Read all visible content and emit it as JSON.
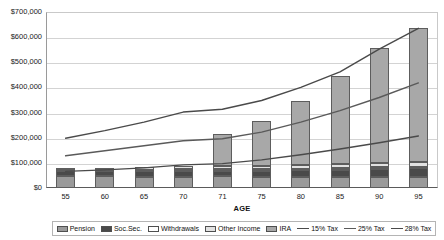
{
  "chart_data": {
    "type": "bar",
    "subtype": "stacked-bar-with-lines",
    "title": "",
    "xlabel": "AGE",
    "ylabel": "",
    "categories": [
      "55",
      "60",
      "65",
      "70",
      "71",
      "75",
      "80",
      "85",
      "90",
      "95"
    ],
    "ylim": [
      0,
      700000
    ],
    "y_ticks": [
      0,
      100000,
      200000,
      300000,
      400000,
      500000,
      600000,
      700000
    ],
    "y_tick_labels": [
      "$0",
      "$100,000",
      "$200,000",
      "$300,000",
      "$400,000",
      "$500,000",
      "$600,000",
      "$700,000"
    ],
    "grid": true,
    "legend_position": "bottom",
    "series": [
      {
        "name": "Pension",
        "kind": "bar",
        "color": "#9a9a9a",
        "values": [
          46000,
          46000,
          45000,
          44000,
          46000,
          45000,
          45000,
          45000,
          45000,
          45000
        ]
      },
      {
        "name": "Soc.Sec.",
        "kind": "bar",
        "color": "#4a4a4a",
        "values": [
          20000,
          20000,
          21000,
          22000,
          22000,
          24000,
          26000,
          28000,
          31000,
          34000
        ]
      },
      {
        "name": "Withdrawals",
        "kind": "bar",
        "color": "#ffffff",
        "values": [
          5000,
          5000,
          6000,
          8000,
          6000,
          6000,
          6000,
          6000,
          6000,
          6000
        ]
      },
      {
        "name": "Other Income",
        "kind": "bar",
        "color": "#e2e2e2",
        "values": [
          10000,
          10000,
          11000,
          13000,
          12000,
          13000,
          14000,
          16000,
          18000,
          20000
        ]
      },
      {
        "name": "IRA",
        "kind": "bar",
        "color": "#a8a8a8",
        "values": [
          0,
          0,
          0,
          0,
          128000,
          178000,
          255000,
          350000,
          455000,
          530000
        ]
      },
      {
        "name": "15% Tax",
        "kind": "line",
        "color": "#4a4a4a",
        "values": [
          198000,
          228000,
          262000,
          302000,
          313000,
          348000,
          400000,
          462000,
          552000,
          635000
        ]
      },
      {
        "name": "25% Tax",
        "kind": "line",
        "color": "#5a5a5a",
        "values": [
          128000,
          148000,
          168000,
          188000,
          196000,
          222000,
          262000,
          308000,
          360000,
          418000
        ]
      },
      {
        "name": "28% Tax",
        "kind": "line",
        "color": "#4a4a4a",
        "values": [
          66000,
          72000,
          80000,
          92000,
          97000,
          112000,
          132000,
          155000,
          180000,
          207000
        ]
      }
    ],
    "bar_totals": [
      81000,
      81000,
      83000,
      87000,
      214000,
      266000,
      346000,
      445000,
      555000,
      635000
    ]
  },
  "legend": {
    "items": [
      {
        "label": "Pension",
        "marker": "swatch",
        "color": "#9a9a9a"
      },
      {
        "label": "Soc.Sec.",
        "marker": "swatch",
        "color": "#4a4a4a"
      },
      {
        "label": "Withdrawals",
        "marker": "swatch",
        "color": "#ffffff"
      },
      {
        "label": "Other Income",
        "marker": "swatch",
        "color": "#e2e2e2"
      },
      {
        "label": "IRA",
        "marker": "swatch",
        "color": "#a8a8a8"
      },
      {
        "label": "15% Tax",
        "marker": "line",
        "color": "#4a4a4a"
      },
      {
        "label": "25% Tax",
        "marker": "line",
        "color": "#5a5a5a"
      },
      {
        "label": "28% Tax",
        "marker": "line",
        "color": "#4a4a4a"
      }
    ]
  }
}
